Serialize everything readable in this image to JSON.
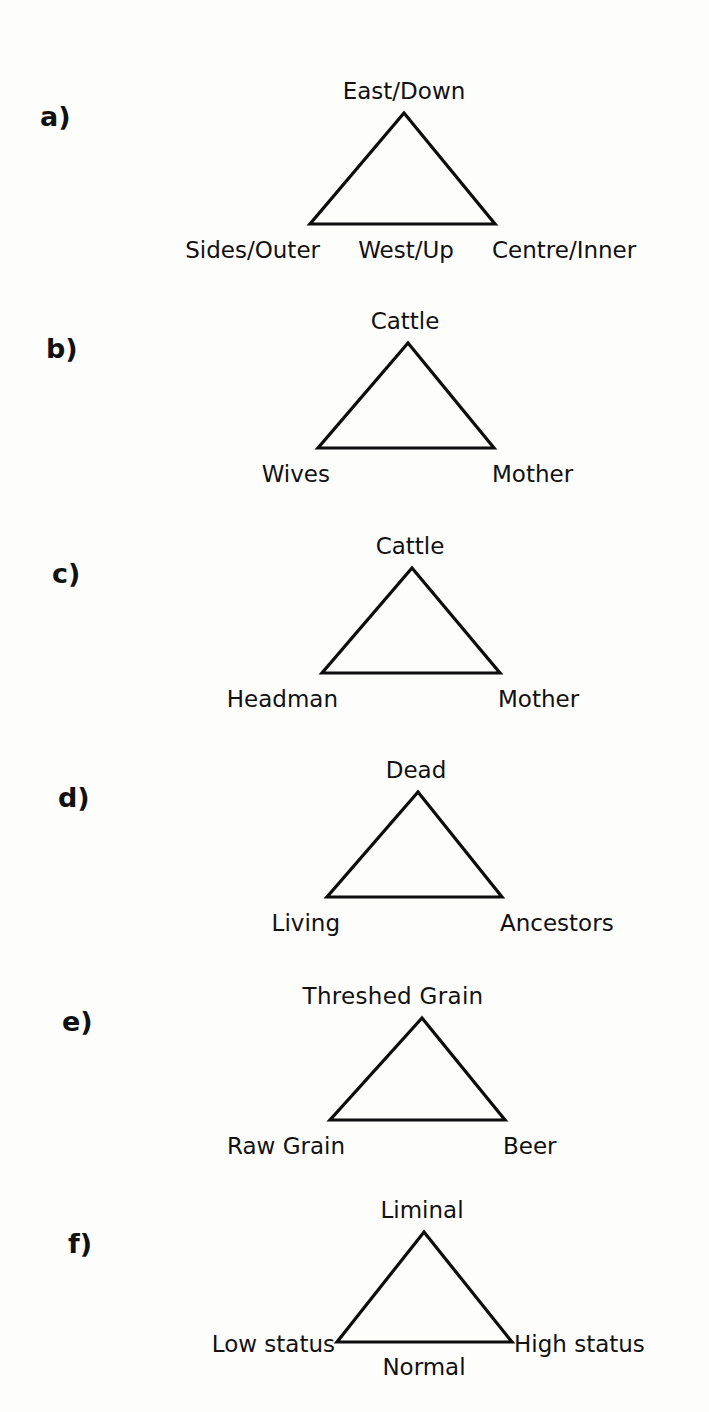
{
  "figure": {
    "background_color": "#fdfdfc",
    "line_color": "#0d0d0d",
    "text_color": "#111111"
  },
  "panels": [
    {
      "letter": "a)",
      "apex": "East/Down",
      "left": "Sides/Outer",
      "right": "Centre/Inner",
      "base_center": "West/Up"
    },
    {
      "letter": "b)",
      "apex": "Cattle",
      "left": "Wives",
      "right": "Mother",
      "base_center": ""
    },
    {
      "letter": "c)",
      "apex": "Cattle",
      "left": "Headman",
      "right": "Mother",
      "base_center": ""
    },
    {
      "letter": "d)",
      "apex": "Dead",
      "left": "Living",
      "right": "Ancestors",
      "base_center": ""
    },
    {
      "letter": "e)",
      "apex": "Threshed  Grain",
      "left": "Raw Grain",
      "right": "Beer",
      "base_center": ""
    },
    {
      "letter": "f)",
      "apex": "Liminal",
      "left": "Low status",
      "right": "High status",
      "base_center": "Normal"
    }
  ]
}
